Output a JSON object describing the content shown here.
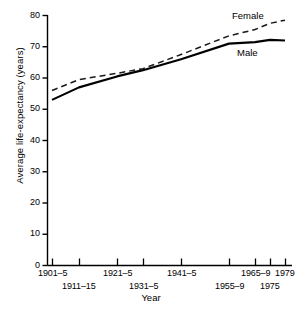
{
  "chart_data": {
    "type": "line",
    "title": "",
    "xlabel": "Year",
    "ylabel": "Average life-expectancy (years)",
    "ylim": [
      0,
      80
    ],
    "ytick_values": [
      0,
      10,
      20,
      30,
      40,
      50,
      60,
      70,
      80
    ],
    "ytick_labels": [
      "0",
      "10",
      "20",
      "30",
      "40",
      "50",
      "60",
      "70",
      "80"
    ],
    "grid": false,
    "legend_position": "inline-right",
    "categories": [
      "1901–5",
      "1911–15",
      "1921–5",
      "1931–5",
      "1941–5",
      "1955–9",
      "1965–9",
      "1975",
      "1979"
    ],
    "xtick_rows": [
      [
        "1901–5",
        "1921–5",
        "1941–5",
        "1965–9",
        "1979"
      ],
      [
        "1911–15",
        "1931–5",
        "1955–9",
        "1975"
      ]
    ],
    "series": [
      {
        "name": "Female",
        "style": "dashed",
        "color": "#1a1a1a",
        "values": [
          56.0,
          59.5,
          61.5,
          63.0,
          67.5,
          73.5,
          75.5,
          77.5,
          78.5
        ]
      },
      {
        "name": "Male",
        "style": "solid",
        "color": "#000000",
        "values": [
          53.0,
          57.0,
          60.5,
          62.5,
          66.0,
          71.0,
          71.5,
          72.2,
          72.0
        ]
      }
    ],
    "annotations": [
      {
        "text": "Female",
        "series": "Female"
      },
      {
        "text": "Male",
        "series": "Male"
      }
    ]
  },
  "figure": {
    "caption": ""
  }
}
